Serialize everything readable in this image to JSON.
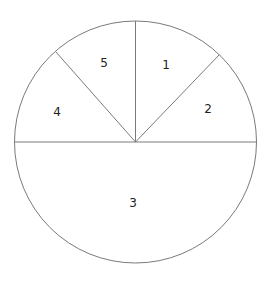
{
  "diagram": {
    "type": "sector-diagram",
    "circle": {
      "cx": 135.5,
      "cy": 142,
      "r": 121
    },
    "colors": {
      "stroke": "#7a7a7a",
      "fill": "#ffffff",
      "text": "#222222"
    },
    "lines": [
      {
        "name": "horizontal-diameter",
        "x1": 14.5,
        "y1": 142,
        "x2": 256.5,
        "y2": 142
      },
      {
        "name": "vertical-radius",
        "x1": 135.5,
        "y1": 142,
        "x2": 135.5,
        "y2": 21
      },
      {
        "name": "diagonal-left",
        "x1": 135.5,
        "y1": 142,
        "x2": 56,
        "y2": 52
      },
      {
        "name": "diagonal-right",
        "x1": 135.5,
        "y1": 142,
        "x2": 219,
        "y2": 55
      }
    ],
    "segments": [
      {
        "label": "1",
        "x": 166,
        "y": 69
      },
      {
        "label": "2",
        "x": 208,
        "y": 113
      },
      {
        "label": "3",
        "x": 133,
        "y": 207
      },
      {
        "label": "4",
        "x": 57,
        "y": 116
      },
      {
        "label": "5",
        "x": 104,
        "y": 67
      }
    ]
  }
}
